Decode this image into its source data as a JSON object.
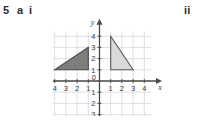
{
  "question": {
    "number": "5",
    "part": "a",
    "roman_first": "i",
    "roman_second": "ii"
  },
  "chart_data": {
    "type": "scatter",
    "title": "",
    "subtitle": "",
    "xlabel": "x",
    "ylabel": "y",
    "xlim": [
      -4.6,
      4.6
    ],
    "ylim": [
      -3.2,
      4.4
    ],
    "grid": true,
    "grid_step": 1,
    "legend": "none",
    "x_ticks": [
      -4,
      -3,
      -2,
      -1,
      0,
      1,
      2,
      3,
      4
    ],
    "x_tick_labels": [
      "4",
      "3",
      "2",
      "1",
      "0",
      "1",
      "2",
      "3",
      "4"
    ],
    "y_ticks": [
      4,
      3,
      2,
      1,
      0,
      -1,
      -2,
      -3
    ],
    "y_tick_labels": [
      "4",
      "3",
      "2",
      "1",
      "0",
      "1",
      "2",
      "3"
    ],
    "origin_label": "0",
    "axis_arrow_x": "right",
    "axis_arrow_y": "up",
    "series": [
      {
        "name": "triangle-dark",
        "type": "polygon",
        "points": [
          [
            -4,
            1
          ],
          [
            -1,
            1
          ],
          [
            -1,
            3
          ]
        ],
        "fill": "#7d7d7d",
        "stroke": "#4a4a4a"
      },
      {
        "name": "triangle-light",
        "type": "polygon",
        "points": [
          [
            1,
            4
          ],
          [
            1,
            1
          ],
          [
            3,
            1
          ]
        ],
        "fill": "#d9d9d9",
        "stroke": "#5a5a5a"
      }
    ],
    "colors": {
      "grid": "#d5d5dd",
      "axis": "#4a4a4a",
      "tick_text": "#3a3a3a",
      "triangle_dark_fill": "#7d7d7d",
      "triangle_light_fill": "#d9d9d9",
      "outline": "#4a4a4a",
      "background": "#ffffff"
    }
  }
}
